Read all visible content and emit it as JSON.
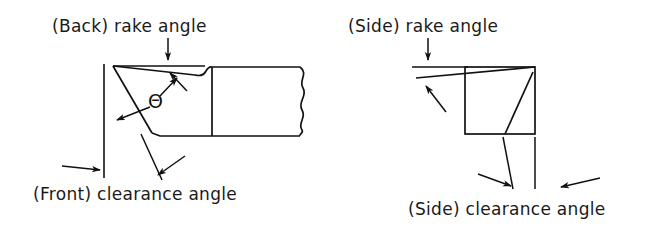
{
  "figure": {
    "width": 653,
    "height": 243,
    "background_color": "#ffffff",
    "line_color": "#111111"
  },
  "labels": {
    "back_rake_angle": "(Back) rake angle",
    "front_clearance_angle": "(Front) clearance angle",
    "side_rake_angle": "(Side) rake angle",
    "side_clearance_angle": "(Side) clearance angle",
    "theta_symbol": "Θ"
  },
  "views": {
    "left": {
      "name": "front-view",
      "description": "Tool shank shown from the front with wedge-shaped cutting tip at the left end and a wavy break line at the right end",
      "annotated_angles": [
        "(Back) rake angle",
        "(Front) clearance angle",
        "Θ"
      ]
    },
    "right": {
      "name": "side-view",
      "description": "Tool shank shown from the side as a rectangle with inclined rake face across the top and inclined clearance face at the right",
      "annotated_angles": [
        "(Side) rake angle",
        "(Side) clearance angle"
      ]
    }
  },
  "geometry": {
    "left_view": {
      "tool_apex": [
        113,
        66
      ],
      "rake_face_end": [
        212,
        77
      ],
      "flank_line_end": [
        152,
        133
      ],
      "body_top_y": 68,
      "body_bottom_y": 136,
      "body_left_x": 212,
      "break_line_x": 305,
      "reference_vertical_x": 104,
      "reference_vertical_top_y": 66,
      "reference_vertical_bottom_y": 178,
      "horizontal_reference_y": 66,
      "horizontal_reference_x1": 113,
      "horizontal_reference_x2": 200
    },
    "right_view": {
      "box_left_x": 465,
      "box_right_x": 535,
      "box_top_y": 67,
      "box_bottom_y": 134,
      "rake_line_start": [
        418,
        77
      ],
      "rake_line_end": [
        535,
        67
      ],
      "clearance_line_top": [
        532,
        73
      ],
      "clearance_line_bottom": [
        505,
        134
      ],
      "horizontal_reference_y": 67,
      "horizontal_reference_x1": 414,
      "horizontal_reference_x2": 468
    }
  },
  "arrows": {
    "back_rake_upper": {
      "from": [
        168,
        40
      ],
      "to": [
        168,
        63
      ],
      "direction": "down"
    },
    "back_rake_lower": {
      "from": [
        185,
        88
      ],
      "to": [
        168,
        71
      ],
      "direction": "up-left"
    },
    "front_clearance_left": {
      "from": [
        65,
        167
      ],
      "to": [
        101,
        170
      ],
      "direction": "right"
    },
    "front_clearance_right": {
      "from": [
        182,
        158
      ],
      "to": [
        155,
        177
      ],
      "direction": "down-left"
    },
    "theta_leader": {
      "from": [
        150,
        105
      ],
      "to": [
        120,
        119
      ],
      "direction": "down-left"
    },
    "theta_leader_up": {
      "from": [
        158,
        94
      ],
      "to": [
        175,
        76
      ],
      "direction": "up-right"
    },
    "side_rake_upper": {
      "from": [
        428,
        40
      ],
      "to": [
        428,
        62
      ],
      "direction": "down"
    },
    "side_rake_lower": {
      "from": [
        443,
        108
      ],
      "to": [
        424,
        84
      ],
      "direction": "up-left"
    },
    "side_clearance_left": {
      "from": [
        480,
        175
      ],
      "to": [
        513,
        185
      ],
      "direction": "right"
    },
    "side_clearance_right": {
      "from": [
        595,
        178
      ],
      "to": [
        558,
        186
      ],
      "direction": "left"
    }
  }
}
